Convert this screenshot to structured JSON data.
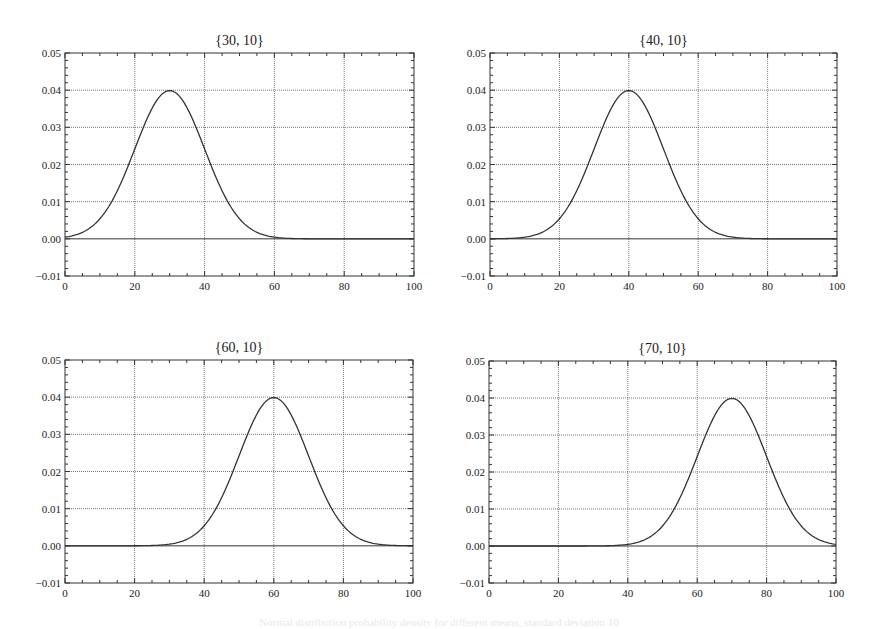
{
  "figure": {
    "caption": "Normal distribution probability density for different means, standard deviation 10"
  },
  "chart_data": [
    {
      "type": "line",
      "title": "{30, 10}",
      "mean": 30,
      "sd": 10,
      "xlabel": "",
      "ylabel": "",
      "xlim": [
        0,
        100
      ],
      "ylim": [
        -0.01,
        0.05
      ],
      "xticks": [
        "0",
        "20",
        "40",
        "60",
        "80",
        "100"
      ],
      "yticks": [
        "-0.01",
        "0.00",
        "0.01",
        "0.02",
        "0.03",
        "0.04",
        "0.05"
      ],
      "grid": true,
      "x": [
        0,
        10,
        20,
        25,
        30,
        35,
        40,
        50,
        60,
        70,
        80,
        90,
        100
      ],
      "values": [
        0.00044,
        0.0054,
        0.0242,
        0.0352,
        0.0399,
        0.0352,
        0.0242,
        0.0054,
        0.00044,
        1.34e-05,
        0.0,
        0.0,
        0.0
      ]
    },
    {
      "type": "line",
      "title": "{40, 10}",
      "mean": 40,
      "sd": 10,
      "xlabel": "",
      "ylabel": "",
      "xlim": [
        0,
        100
      ],
      "ylim": [
        -0.01,
        0.05
      ],
      "xticks": [
        "0",
        "20",
        "40",
        "60",
        "80",
        "100"
      ],
      "yticks": [
        "-0.01",
        "0.00",
        "0.01",
        "0.02",
        "0.03",
        "0.04",
        "0.05"
      ],
      "grid": true,
      "x": [
        0,
        10,
        20,
        30,
        35,
        40,
        45,
        50,
        60,
        70,
        80,
        90,
        100
      ],
      "values": [
        1.34e-05,
        0.00044,
        0.0054,
        0.0242,
        0.0352,
        0.0399,
        0.0352,
        0.0242,
        0.0054,
        0.00044,
        1.34e-05,
        0.0,
        0.0
      ]
    },
    {
      "type": "line",
      "title": "{60, 10}",
      "mean": 60,
      "sd": 10,
      "xlabel": "",
      "ylabel": "",
      "xlim": [
        0,
        100
      ],
      "ylim": [
        -0.01,
        0.05
      ],
      "xticks": [
        "0",
        "20",
        "40",
        "60",
        "80",
        "100"
      ],
      "yticks": [
        "-0.01",
        "0.00",
        "0.01",
        "0.02",
        "0.03",
        "0.04",
        "0.05"
      ],
      "grid": true,
      "x": [
        0,
        10,
        20,
        30,
        40,
        50,
        55,
        60,
        65,
        70,
        80,
        90,
        100
      ],
      "values": [
        0.0,
        0.0,
        1.34e-05,
        0.00044,
        0.0054,
        0.0242,
        0.0352,
        0.0399,
        0.0352,
        0.0242,
        0.0054,
        0.00044,
        1.34e-05
      ]
    },
    {
      "type": "line",
      "title": "{70, 10}",
      "mean": 70,
      "sd": 10,
      "xlabel": "",
      "ylabel": "",
      "xlim": [
        0,
        100
      ],
      "ylim": [
        -0.01,
        0.05
      ],
      "xticks": [
        "0",
        "20",
        "40",
        "60",
        "80",
        "100"
      ],
      "yticks": [
        "-0.01",
        "0.00",
        "0.01",
        "0.02",
        "0.03",
        "0.04",
        "0.05"
      ],
      "grid": true,
      "x": [
        0,
        10,
        20,
        30,
        40,
        50,
        60,
        65,
        70,
        75,
        80,
        90,
        100
      ],
      "values": [
        0.0,
        0.0,
        0.0,
        1.34e-05,
        0.00044,
        0.0054,
        0.0242,
        0.0352,
        0.0399,
        0.0352,
        0.0242,
        0.0054,
        0.00044
      ]
    }
  ]
}
